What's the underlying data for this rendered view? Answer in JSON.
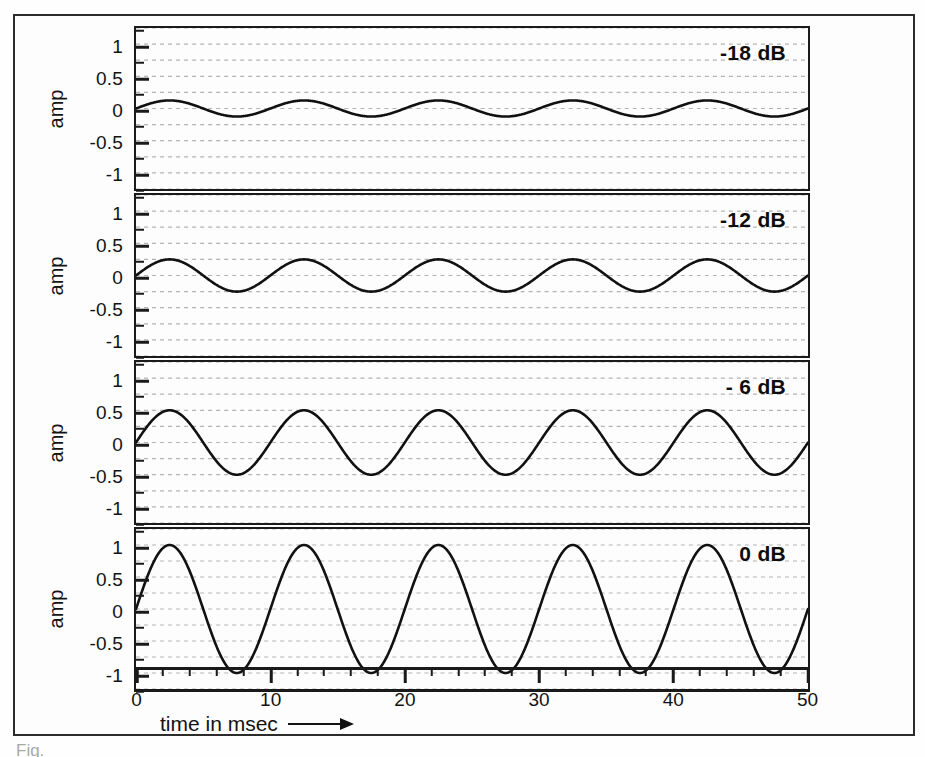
{
  "figure": {
    "caption_partial": "Fig.",
    "amp_axis_label": "amp",
    "x_axis_title": "time in msec",
    "x_axis_arrow_icon": "right-arrow-icon"
  },
  "chart_data": {
    "type": "line",
    "title": "",
    "subtitle": "",
    "xlabel": "time in msec",
    "ylabel": "amp",
    "xlim": [
      0,
      50
    ],
    "ylim": [
      -1.25,
      1.25
    ],
    "xticks": [
      0,
      10,
      20,
      30,
      40,
      50
    ],
    "xtick_labels": [
      "0",
      "10",
      "20",
      "30",
      "40",
      "50"
    ],
    "xtick_minor_step": 2,
    "yticks": [
      1,
      0.5,
      0,
      -0.5,
      -1
    ],
    "ytick_labels": [
      "1",
      "0.5",
      "0",
      "-0.5",
      "-1"
    ],
    "ytick_minor": [
      1.25,
      0.75,
      0.25,
      -0.25,
      -0.75,
      -1.25
    ],
    "grid": true,
    "grid_style": "dotted-horizontal",
    "grid_levels": [
      1.25,
      1.0,
      0.75,
      0.5,
      0.25,
      0.0,
      -0.25,
      -0.5,
      -0.75,
      -1.0,
      -1.25
    ],
    "legend_position": "none",
    "waveform": "sine",
    "period_ms": 10,
    "cycles": 5,
    "phase_deg": 0,
    "line_color": "#111111",
    "panels": [
      {
        "index": 0,
        "annotation": "-18 dB",
        "db": -18,
        "amplitude": 0.125,
        "series": [
          {
            "name": "-18 dB sine",
            "amplitude": 0.125,
            "period_ms": 10,
            "phase_deg": 0
          }
        ],
        "peaks_ms": [
          2.5,
          12.5,
          22.5,
          32.5,
          42.5
        ],
        "troughs_ms": [
          7.5,
          17.5,
          27.5,
          37.5,
          47.5
        ],
        "peak_value": 0.125,
        "trough_value": -0.125
      },
      {
        "index": 1,
        "annotation": "-12 dB",
        "db": -12,
        "amplitude": 0.25,
        "series": [
          {
            "name": "-12 dB sine",
            "amplitude": 0.25,
            "period_ms": 10,
            "phase_deg": 0
          }
        ],
        "peaks_ms": [
          2.5,
          12.5,
          22.5,
          32.5,
          42.5
        ],
        "troughs_ms": [
          7.5,
          17.5,
          27.5,
          37.5,
          47.5
        ],
        "peak_value": 0.25,
        "trough_value": -0.25
      },
      {
        "index": 2,
        "annotation": "- 6 dB",
        "db": -6,
        "amplitude": 0.5,
        "series": [
          {
            "name": "-6 dB sine",
            "amplitude": 0.5,
            "period_ms": 10,
            "phase_deg": 0
          }
        ],
        "peaks_ms": [
          2.5,
          12.5,
          22.5,
          32.5,
          42.5
        ],
        "troughs_ms": [
          7.5,
          17.5,
          27.5,
          37.5,
          47.5
        ],
        "peak_value": 0.5,
        "trough_value": -0.5
      },
      {
        "index": 3,
        "annotation": "0 dB",
        "db": 0,
        "amplitude": 1.0,
        "series": [
          {
            "name": "0 dB sine",
            "amplitude": 1.0,
            "period_ms": 10,
            "phase_deg": 0
          }
        ],
        "peaks_ms": [
          2.5,
          12.5,
          22.5,
          32.5,
          42.5
        ],
        "troughs_ms": [
          7.5,
          17.5,
          27.5,
          37.5,
          47.5
        ],
        "peak_value": 1.0,
        "trough_value": -1.0
      }
    ]
  },
  "colors": {
    "frame": "#1a1a1a",
    "line": "#111111",
    "grid": "#b4b4b4",
    "background": "#fdfdfd",
    "text": "#121212"
  }
}
